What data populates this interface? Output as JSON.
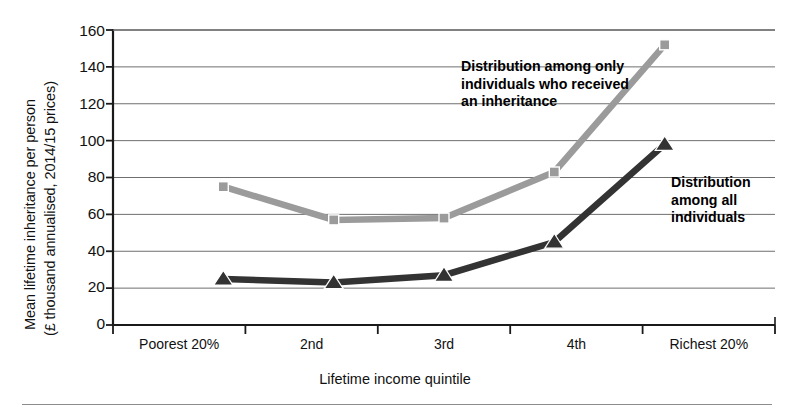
{
  "chart_data": {
    "type": "line",
    "title": "",
    "xlabel": "Lifetime income quintile",
    "ylabel_line1": "Mean lifetime inheritance per person",
    "ylabel_line2": "(£ thousand annualised, 2014/15 prices)",
    "categories": [
      "Poorest 20%",
      "2nd",
      "3rd",
      "4th",
      "Richest 20%"
    ],
    "ylim": [
      0,
      160
    ],
    "yticks": [
      160,
      140,
      120,
      100,
      80,
      60,
      40,
      20,
      0
    ],
    "grid": true,
    "legend_position": "inline-annotations",
    "series": [
      {
        "name": "Distribution among only individuals who received an inheritance",
        "values": [
          75,
          57,
          58,
          83,
          152
        ],
        "color": "#9b9b9b",
        "marker": "square"
      },
      {
        "name": "Distribution among all individuals",
        "values": [
          25,
          23,
          27,
          45,
          98
        ],
        "color": "#333333",
        "marker": "triangle"
      }
    ],
    "annotations": [
      {
        "id": "annot-received",
        "text": "Distribution among only\nindividuals who received\nan inheritance"
      },
      {
        "id": "annot-all",
        "text": "Distribution\namong all\nindividuals"
      }
    ]
  },
  "axes": {
    "y_tick_0": "0",
    "y_tick_20": "20",
    "y_tick_40": "40",
    "y_tick_60": "60",
    "y_tick_80": "80",
    "y_tick_100": "100",
    "y_tick_120": "120",
    "y_tick_140": "140",
    "y_tick_160": "160"
  },
  "colors": {
    "series_light": "#9b9b9b",
    "series_dark": "#333333",
    "gridline": "#6f6f6f",
    "axis": "#1a1a1a",
    "rule": "#8d8d8d",
    "background": "#ffffff"
  }
}
